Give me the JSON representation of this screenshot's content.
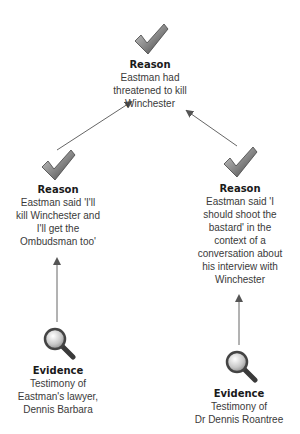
{
  "diagram": {
    "type": "argument-map",
    "nodes": [
      {
        "id": "top-reason",
        "kind": "Reason",
        "icon": "checkmark-icon",
        "title": "Reason",
        "lines": [
          "Eastman had",
          "threatened to kill",
          "Winchester"
        ]
      },
      {
        "id": "left-reason",
        "kind": "Reason",
        "icon": "checkmark-icon",
        "title": "Reason",
        "lines": [
          "Eastman said 'I'll",
          "kill Winchester and",
          "I'll get the",
          "Ombudsman too'"
        ]
      },
      {
        "id": "right-reason",
        "kind": "Reason",
        "icon": "checkmark-icon",
        "title": "Reason",
        "lines": [
          "Eastman said 'I",
          "should shoot the",
          "bastard' in the",
          "context of a",
          "conversation about",
          "his interview with",
          "Winchester"
        ]
      },
      {
        "id": "left-evidence",
        "kind": "Evidence",
        "icon": "magnifier-icon",
        "title": "Evidence",
        "lines": [
          "Testimony of",
          "Eastman's lawyer,",
          "Dennis Barbara"
        ]
      },
      {
        "id": "right-evidence",
        "kind": "Evidence",
        "icon": "magnifier-icon",
        "title": "Evidence",
        "lines": [
          "Testimony of",
          "Dr Dennis Roantree"
        ]
      }
    ],
    "edges": [
      {
        "from": "left-reason",
        "to": "top-reason"
      },
      {
        "from": "right-reason",
        "to": "top-reason"
      },
      {
        "from": "left-evidence",
        "to": "left-reason"
      },
      {
        "from": "right-evidence",
        "to": "right-reason"
      }
    ],
    "colors": {
      "line": "#555555",
      "icon_dark": "#4a4a4a",
      "icon_light": "#b8b8b8",
      "text": "#3a3a3a",
      "title": "#1a1a1a"
    }
  }
}
